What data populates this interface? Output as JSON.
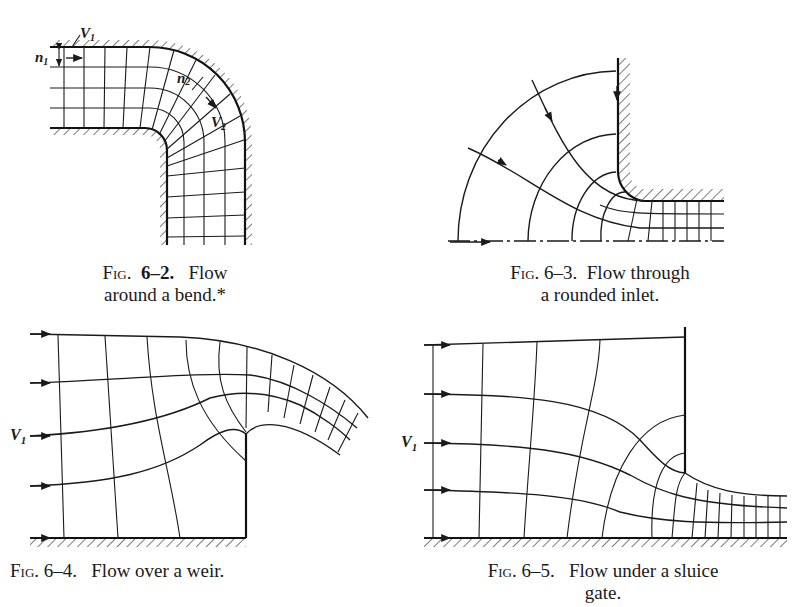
{
  "figures": [
    {
      "id": "fig-6-2",
      "caption_prefix": "Fig.",
      "caption_number": "6–2.",
      "caption_line1": "Flow",
      "caption_line2": "around a bend.*",
      "labels": {
        "v1": "V",
        "v1_sub": "1",
        "n1": "n",
        "n1_sub": "1",
        "n2": "n",
        "n2_sub": "2",
        "v2": "V",
        "v2_sub": "2"
      }
    },
    {
      "id": "fig-6-3",
      "caption_prefix": "Fig.",
      "caption_number": "6–3.",
      "caption_line1": "Flow through",
      "caption_line2": "a rounded inlet."
    },
    {
      "id": "fig-6-4",
      "caption_prefix": "Fig.",
      "caption_number": "6–4.",
      "caption_line1": "Flow over a weir.",
      "labels": {
        "v1": "V",
        "v1_sub": "1"
      }
    },
    {
      "id": "fig-6-5",
      "caption_prefix": "Fig.",
      "caption_number": "6–5.",
      "caption_line1": "Flow under a sluice",
      "caption_line2": "gate.",
      "labels": {
        "v1": "V",
        "v1_sub": "1"
      }
    }
  ],
  "colors": {
    "ink": "#1a1a1a",
    "background": "#ffffff"
  }
}
